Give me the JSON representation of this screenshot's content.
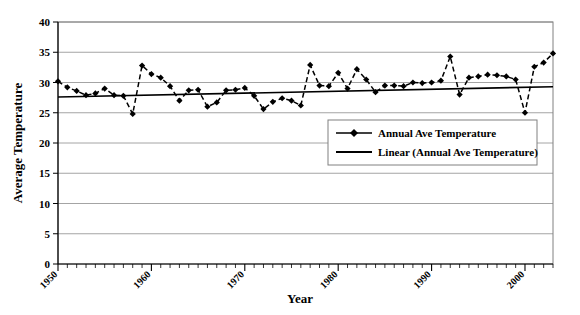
{
  "chart_data": {
    "type": "line",
    "title": "",
    "xlabel": "Year",
    "ylabel": "Average Temperature",
    "xlim": [
      1950,
      2003
    ],
    "ylim": [
      0,
      40
    ],
    "ytick_values": [
      0,
      5,
      10,
      15,
      20,
      25,
      30,
      35,
      40
    ],
    "ytick_labels": [
      "0",
      "5",
      "10",
      "15",
      "20",
      "25",
      "30",
      "35",
      "40"
    ],
    "xtick_values": [
      1950,
      1960,
      1970,
      1980,
      1990,
      2000
    ],
    "xtick_labels": [
      "1950",
      "1960",
      "1970",
      "1980",
      "1990",
      "2000"
    ],
    "xtick_minor_step": 1,
    "grid": "horizontal",
    "legend_position": "inside-center-right",
    "legend": [
      {
        "label": "Annual Ave Temperature",
        "marker": "diamond",
        "line": "dashed",
        "color": "#000000"
      },
      {
        "label": "Linear (Annual Ave Temperature)",
        "marker": "none",
        "line": "solid",
        "color": "#000000"
      }
    ],
    "series": [
      {
        "name": "Annual Ave Temperature",
        "x": [
          1950,
          1951,
          1952,
          1953,
          1954,
          1955,
          1956,
          1957,
          1958,
          1959,
          1960,
          1961,
          1962,
          1963,
          1964,
          1965,
          1966,
          1967,
          1968,
          1969,
          1970,
          1971,
          1972,
          1973,
          1974,
          1975,
          1976,
          1977,
          1978,
          1979,
          1980,
          1981,
          1982,
          1983,
          1984,
          1985,
          1986,
          1987,
          1988,
          1989,
          1990,
          1991,
          1992,
          1993,
          1994,
          1995,
          1996,
          1997,
          1998,
          1999,
          2000,
          2001,
          2002,
          2003
        ],
        "values": [
          30.2,
          29.2,
          28.6,
          27.9,
          28.2,
          29.0,
          27.9,
          27.8,
          24.8,
          32.8,
          31.4,
          30.8,
          29.4,
          27.0,
          28.7,
          28.8,
          26.0,
          26.7,
          28.7,
          28.8,
          29.1,
          27.8,
          25.6,
          26.8,
          27.4,
          27.0,
          26.2,
          32.9,
          29.5,
          29.4,
          31.6,
          29.0,
          32.2,
          30.5,
          28.4,
          29.5,
          29.5,
          29.4,
          30.0,
          29.9,
          30.0,
          30.3,
          34.3,
          28.0,
          30.8,
          31.0,
          31.3,
          31.2,
          31.0,
          30.5,
          25.0,
          32.6,
          33.3,
          34.8
        ]
      },
      {
        "name": "Linear (Annual Ave Temperature)",
        "type": "trendline",
        "x": [
          1950,
          2003
        ],
        "values": [
          27.6,
          29.3
        ]
      }
    ]
  }
}
